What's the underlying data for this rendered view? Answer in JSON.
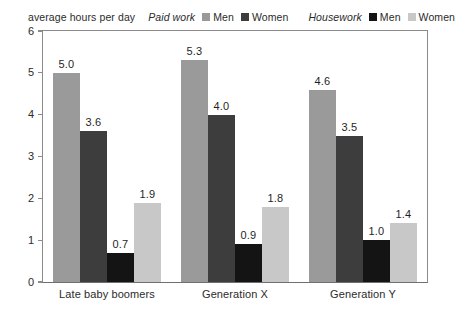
{
  "axis_caption": "average hours per day",
  "legend": [
    {
      "title": "Paid work",
      "entries": [
        {
          "label": "Men",
          "color": "#9a9a9a",
          "icon": "square-swatch-icon"
        },
        {
          "label": "Women",
          "color": "#3d3d3d",
          "icon": "square-swatch-icon"
        }
      ]
    },
    {
      "title": "Housework",
      "entries": [
        {
          "label": "Men",
          "color": "#141414",
          "icon": "square-swatch-icon"
        },
        {
          "label": "Women",
          "color": "#c8c8c8",
          "icon": "square-swatch-icon"
        }
      ]
    }
  ],
  "chart_data": {
    "type": "bar",
    "title": "",
    "subtitle": "",
    "xlabel": "",
    "ylabel": "average hours per day",
    "ylim": [
      0,
      6
    ],
    "yticks": [
      0,
      1,
      2,
      3,
      4,
      5,
      6
    ],
    "ytick_labels": [
      "0",
      "1",
      "2",
      "3",
      "4",
      "5",
      "6"
    ],
    "grid": false,
    "legend_position": "top",
    "categories": [
      "Late baby boomers",
      "Generation X",
      "Generation Y"
    ],
    "series": [
      {
        "name": "Paid work Men",
        "color": "#9a9a9a",
        "values": [
          5.0,
          5.3,
          4.6
        ],
        "labels": [
          "5.0",
          "5.3",
          "4.6"
        ]
      },
      {
        "name": "Paid work Women",
        "color": "#3d3d3d",
        "values": [
          3.6,
          4.0,
          3.5
        ],
        "labels": [
          "3.6",
          "4.0",
          "3.5"
        ]
      },
      {
        "name": "Housework Men",
        "color": "#141414",
        "values": [
          0.7,
          0.9,
          1.0
        ],
        "labels": [
          "0.7",
          "0.9",
          "1.0"
        ]
      },
      {
        "name": "Housework Women",
        "color": "#c8c8c8",
        "values": [
          1.9,
          1.8,
          1.4
        ],
        "labels": [
          "1.9",
          "1.8",
          "1.4"
        ]
      }
    ]
  }
}
